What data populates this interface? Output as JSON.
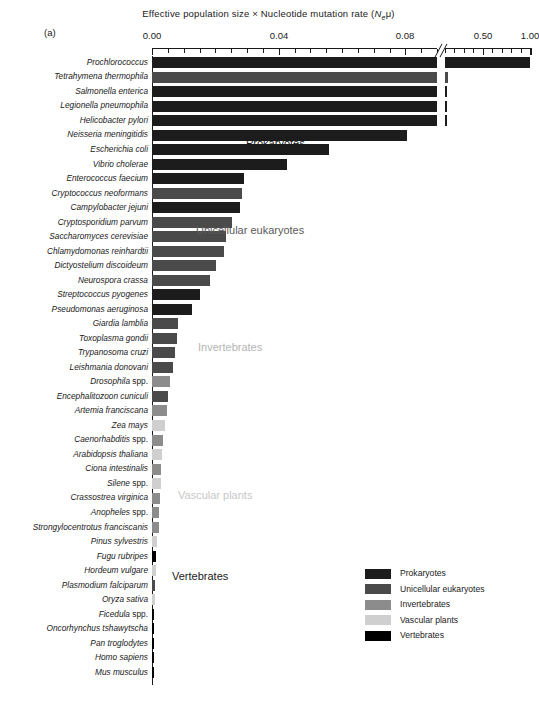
{
  "figure": {
    "panel_label": "(a)",
    "axis_title_prefix": "Effective population size × Nucleotide mutation rate (",
    "axis_title_var": "N",
    "axis_title_sub": "e",
    "axis_title_mu": "μ",
    "axis_title_suffix": ")",
    "axis_title_full": "Effective population size × Nucleotide mutation rate (Neμ)"
  },
  "annotations": [
    {
      "text": "Prokaryotes",
      "x": 246,
      "y": 137,
      "color": "#1a1a1a"
    },
    {
      "text": "Unicellular eukaryotes",
      "x": 196,
      "y": 224,
      "color": "#5a5a5a"
    },
    {
      "text": "Invertebrates",
      "x": 198,
      "y": 341,
      "color": "#b4b4b4"
    },
    {
      "text": "Vascular plants",
      "x": 178,
      "y": 489,
      "color": "#c8c8c8"
    },
    {
      "text": "Vertebrates",
      "x": 172,
      "y": 570,
      "color": "#1a1a1a"
    }
  ],
  "legend": {
    "items": [
      {
        "label": "Prokaryotes",
        "color": "#1c1c1c"
      },
      {
        "label": "Unicellular eukaryotes",
        "color": "#4a4a4a"
      },
      {
        "label": "Invertebrates",
        "color": "#8c8c8c"
      },
      {
        "label": "Vascular plants",
        "color": "#cfcfcf"
      },
      {
        "label": "Vertebrates",
        "color": "#000000"
      }
    ]
  },
  "chart_data": {
    "type": "bar",
    "orientation": "horizontal",
    "title": "Effective population size × Nucleotide mutation rate (Neμ)",
    "xlabel": "Effective population size × Nucleotide mutation rate (Neμ)",
    "ylabel": "",
    "broken_axis": true,
    "axis_segments": [
      {
        "min": 0.0,
        "max": 0.09,
        "major_ticks": [
          0.0,
          0.04,
          0.08
        ],
        "major_tick_labels": [
          "0.00",
          "0.04",
          "0.08"
        ],
        "minor_tick_step": 0.005
      },
      {
        "min": 0.1,
        "max": 1.05,
        "major_ticks": [
          0.5,
          1.0
        ],
        "major_tick_labels": [
          "0.50",
          "1.00"
        ],
        "minor_tick_step": 0.1
      }
    ],
    "group_colors": {
      "Prokaryotes": "#1c1c1c",
      "Unicellular eukaryotes": "#4a4a4a",
      "Invertebrates": "#8c8c8c",
      "Vascular plants": "#cfcfcf",
      "Vertebrates": "#000000"
    },
    "categories": [
      "Prochlorococcus",
      "Tetrahymena thermophila",
      "Salmonella enterica",
      "Legionella pneumophila",
      "Helicobacter pylori",
      "Neisseria meningitidis",
      "Escherichia coli",
      "Vibrio cholerae",
      "Enterococcus faecium",
      "Cryptococcus neoformans",
      "Campylobacter jejuni",
      "Cryptosporidium parvum",
      "Saccharomyces cerevisiae",
      "Chlamydomonas reinhardtii",
      "Dictyostelium discoideum",
      "Neurospora crassa",
      "Streptococcus pyogenes",
      "Pseudomonas aeruginosa",
      "Giardia lamblia",
      "Toxoplasma gondii",
      "Trypanosoma cruzi",
      "Leishmania donovani",
      "Drosophila spp.",
      "Encephalitozoon cuniculi",
      "Artemia franciscana",
      "Zea mays",
      "Caenorhabditis spp.",
      "Arabidopsis thaliana",
      "Ciona intestinalis",
      "Silene spp.",
      "Crassostrea virginica",
      "Anopheles spp.",
      "Strongylocentrotus franciscanis",
      "Pinus sylvestris",
      "Fugu rubripes",
      "Hordeum vulgare",
      "Plasmodium falciparum",
      "Oryza sativa",
      "Ficedula spp.",
      "Oncorhynchus tshawytscha",
      "Pan troglodytes",
      "Homo sapiens",
      "Mus musculus"
    ],
    "values": [
      1.0,
      0.135,
      0.112,
      0.108,
      0.104,
      0.0805,
      0.0558,
      0.0425,
      0.029,
      0.0283,
      0.0277,
      0.0252,
      0.0235,
      0.0226,
      0.0202,
      0.0182,
      0.0152,
      0.0125,
      0.0083,
      0.0078,
      0.0072,
      0.0066,
      0.0058,
      0.0051,
      0.0046,
      0.004,
      0.0036,
      0.0032,
      0.0029,
      0.0027,
      0.0025,
      0.0023,
      0.0021,
      0.0017,
      0.0013,
      0.0012,
      0.0011,
      0.001,
      0.00075,
      0.00065,
      0.00045,
      0.00035,
      0.00025
    ],
    "groups": [
      "Prokaryotes",
      "Unicellular eukaryotes",
      "Prokaryotes",
      "Prokaryotes",
      "Prokaryotes",
      "Prokaryotes",
      "Prokaryotes",
      "Prokaryotes",
      "Prokaryotes",
      "Unicellular eukaryotes",
      "Prokaryotes",
      "Unicellular eukaryotes",
      "Unicellular eukaryotes",
      "Unicellular eukaryotes",
      "Unicellular eukaryotes",
      "Unicellular eukaryotes",
      "Prokaryotes",
      "Prokaryotes",
      "Unicellular eukaryotes",
      "Unicellular eukaryotes",
      "Unicellular eukaryotes",
      "Unicellular eukaryotes",
      "Invertebrates",
      "Unicellular eukaryotes",
      "Invertebrates",
      "Vascular plants",
      "Invertebrates",
      "Vascular plants",
      "Invertebrates",
      "Vascular plants",
      "Invertebrates",
      "Invertebrates",
      "Invertebrates",
      "Vascular plants",
      "Vertebrates",
      "Vascular plants",
      "Unicellular eukaryotes",
      "Vascular plants",
      "Vertebrates",
      "Vertebrates",
      "Vertebrates",
      "Vertebrates",
      "Vertebrates"
    ]
  }
}
